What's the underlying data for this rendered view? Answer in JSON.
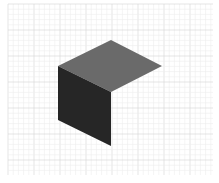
{
  "canvas": {
    "width": 219,
    "height": 183,
    "background": "#ffffff"
  },
  "grid": {
    "x0": 8,
    "y0": 4,
    "x1": 213,
    "y1": 175,
    "minor_step": 5.2,
    "major_every": 5,
    "minor_color": "#ececec",
    "major_color": "#d4d4d4"
  },
  "shape": {
    "name": "isometric-open-cube",
    "faces": [
      {
        "name": "top-face",
        "points": "58,66 111,40 162,66 111,92",
        "color": "#6a6a6a"
      },
      {
        "name": "left-face",
        "points": "58,66 111,92 111,146 58,120",
        "color": "#262626"
      }
    ]
  }
}
